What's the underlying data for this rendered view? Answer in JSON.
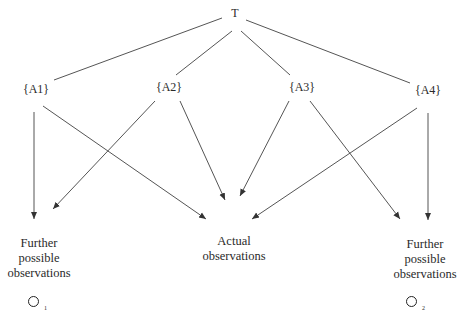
{
  "diagram": {
    "root": {
      "label": "T"
    },
    "hypotheses": [
      {
        "label": "{A1}"
      },
      {
        "label": "{A2}"
      },
      {
        "label": "{A3}"
      },
      {
        "label": "{A4}"
      }
    ],
    "outcomes": {
      "left": {
        "lines": [
          "Further",
          "possible",
          "observations"
        ],
        "symbol": "O",
        "subscript": "1"
      },
      "center": {
        "lines": [
          "Actual",
          "observations"
        ]
      },
      "right": {
        "lines": [
          "Further",
          "possible",
          "observations"
        ],
        "symbol": "O",
        "subscript": "2"
      }
    },
    "edges": [
      {
        "from": "T",
        "to": "{A1}",
        "type": "line"
      },
      {
        "from": "T",
        "to": "{A2}",
        "type": "line"
      },
      {
        "from": "T",
        "to": "{A3}",
        "type": "line"
      },
      {
        "from": "T",
        "to": "{A4}",
        "type": "line"
      },
      {
        "from": "{A1}",
        "to": "Further possible observations (O1)",
        "type": "arrow"
      },
      {
        "from": "{A1}",
        "to": "Actual observations",
        "type": "arrow"
      },
      {
        "from": "{A2}",
        "to": "Further possible observations (O1)",
        "type": "arrow"
      },
      {
        "from": "{A2}",
        "to": "Actual observations",
        "type": "arrow"
      },
      {
        "from": "{A3}",
        "to": "Actual observations",
        "type": "arrow"
      },
      {
        "from": "{A3}",
        "to": "Further possible observations (O2)",
        "type": "arrow"
      },
      {
        "from": "{A4}",
        "to": "Actual observations",
        "type": "arrow"
      },
      {
        "from": "{A4}",
        "to": "Further possible observations (O2)",
        "type": "arrow"
      }
    ],
    "colors": {
      "line": "#555555",
      "text": "#2a2a2a"
    }
  }
}
